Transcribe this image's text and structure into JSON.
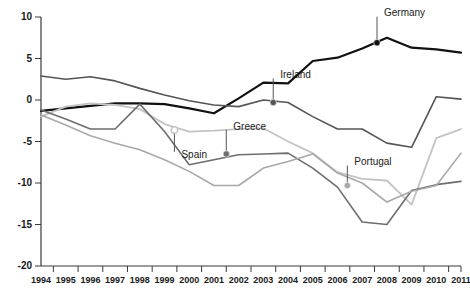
{
  "chart_data": {
    "type": "line",
    "title": "",
    "xlabel": "",
    "ylabel": "",
    "xlim": [
      1994,
      2011
    ],
    "ylim": [
      -20,
      10
    ],
    "grid": false,
    "legend_position": "inline-labels",
    "y_ticks": [
      "10",
      "5",
      "0",
      "-5",
      "-10",
      "-15",
      "-20"
    ],
    "y_tick_values": [
      10,
      5,
      0,
      -5,
      -10,
      -15,
      -20
    ],
    "x": [
      1994,
      1995,
      1996,
      1997,
      1998,
      1999,
      2000,
      2001,
      2002,
      2003,
      2004,
      2005,
      2006,
      2007,
      2008,
      2009,
      2010,
      2011
    ],
    "x_tick_labels": [
      "1994",
      "1995",
      "1996",
      "1997",
      "1998",
      "1999",
      "2000",
      "2001",
      "2002",
      "2003",
      "2004",
      "2005",
      "2006",
      "2007",
      "2008",
      "2009",
      "2010",
      "2011"
    ],
    "series": [
      {
        "name": "Germany",
        "color": "#111111",
        "width": 2.2,
        "values": [
          -1.3,
          -1.0,
          -0.7,
          -0.4,
          -0.4,
          -0.5,
          -1.0,
          -1.6,
          0.2,
          2.1,
          2.0,
          4.7,
          5.1,
          6.2,
          7.5,
          6.3,
          6.1,
          5.7
        ],
        "label": "Germany",
        "label_year": 2007.6,
        "label_value": 6.9,
        "marker": "filled"
      },
      {
        "name": "Ireland",
        "color": "#555555",
        "width": 1.6,
        "values": [
          2.9,
          2.5,
          2.8,
          2.3,
          1.4,
          0.6,
          -0.1,
          -0.6,
          -0.8,
          0.0,
          -0.3,
          -2.0,
          -3.5,
          -3.5,
          -5.2,
          -5.7,
          0.4,
          0.1
        ],
        "label": "Ireland",
        "label_year": 2003.4,
        "label_value": -0.3,
        "marker": "filled"
      },
      {
        "name": "Spain",
        "color": "#c4c4c4",
        "width": 1.8,
        "values": [
          -2.0,
          -0.8,
          -0.4,
          -0.6,
          -1.1,
          -2.9,
          -3.8,
          -3.7,
          -3.5,
          -3.4,
          -5.0,
          -6.4,
          -8.7,
          -9.5,
          -9.7,
          -12.6,
          -4.6,
          -3.5
        ],
        "label": "Spain",
        "label_year": 1999.4,
        "label_value": -3.6,
        "marker": "open"
      },
      {
        "name": "Greece",
        "color": "#6e6e6e",
        "width": 1.6,
        "values": [
          -1.2,
          -2.3,
          -3.5,
          -3.5,
          -0.5,
          -3.8,
          -7.8,
          -7.2,
          -6.6,
          -6.5,
          -6.4,
          -8.2,
          -10.5,
          -14.7,
          -15.0,
          -10.9,
          -10.2,
          -9.8
        ],
        "label": "Greece",
        "label_year": 2001.5,
        "label_value": -6.5,
        "marker": "filled"
      },
      {
        "name": "Portugal",
        "color": "#a8a8a8",
        "width": 1.6,
        "values": [
          -1.8,
          -3.0,
          -4.3,
          -5.2,
          -6.0,
          -7.2,
          -8.6,
          -10.3,
          -10.3,
          -8.2,
          -7.4,
          -6.5,
          -8.8,
          -10.0,
          -12.3,
          -11.0,
          -10.3,
          -6.4
        ],
        "label": "Portugal",
        "label_year": 2006.4,
        "label_value": -10.3,
        "marker": "filled"
      }
    ]
  },
  "annotations": [
    {
      "text": "Germany",
      "name": "series-annotation-germany"
    },
    {
      "text": "Ireland",
      "name": "series-annotation-ireland"
    },
    {
      "text": "Spain",
      "name": "series-annotation-spain"
    },
    {
      "text": "Greece",
      "name": "series-annotation-greece"
    },
    {
      "text": "Portugal",
      "name": "series-annotation-portugal"
    }
  ]
}
